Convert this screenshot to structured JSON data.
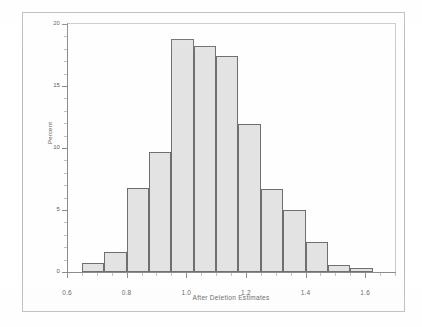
{
  "chart_data": {
    "type": "bar",
    "title": "",
    "subtitle": "",
    "xlabel": "After Deletion Estimates",
    "ylabel": "Percent",
    "xlim": [
      0.6,
      1.7
    ],
    "ylim": [
      0,
      20
    ],
    "grid": false,
    "legend": null,
    "bin_width": 0.075,
    "x_ticks": [
      0.6,
      0.8,
      1.0,
      1.2,
      1.4,
      1.6
    ],
    "x_tick_labels": [
      "0.6",
      "0.8",
      "1.0",
      "1.2",
      "1.4",
      "1.6"
    ],
    "y_ticks": [
      0,
      5,
      10,
      15,
      20
    ],
    "y_tick_labels": [
      "0",
      "5",
      "10",
      "15",
      "20"
    ],
    "bin_edges": [
      0.65,
      0.725,
      0.8,
      0.875,
      0.95,
      1.025,
      1.1,
      1.175,
      1.25,
      1.325,
      1.4,
      1.475,
      1.55,
      1.625
    ],
    "bin_centers": [
      0.6875,
      0.7625,
      0.8375,
      0.9125,
      0.9875,
      1.0625,
      1.1375,
      1.2125,
      1.2875,
      1.3625,
      1.4375,
      1.5125,
      1.5875
    ],
    "categories": [
      "0.65-0.725",
      "0.725-0.80",
      "0.80-0.875",
      "0.875-0.95",
      "0.95-1.025",
      "1.025-1.10",
      "1.10-1.175",
      "1.175-1.25",
      "1.25-1.325",
      "1.325-1.40",
      "1.40-1.475",
      "1.475-1.55",
      "1.55-1.625"
    ],
    "values": [
      0.7,
      1.6,
      6.8,
      9.7,
      18.8,
      18.2,
      17.4,
      11.9,
      6.7,
      5.0,
      2.4,
      0.6,
      0.35
    ],
    "bar_fill_color": "#e3e3e3",
    "bar_border_color": "#6f6f6f",
    "axis_color": "#8a8a8a",
    "text_color": "#5a5a5a",
    "frame_color": "#b9b9b9"
  }
}
